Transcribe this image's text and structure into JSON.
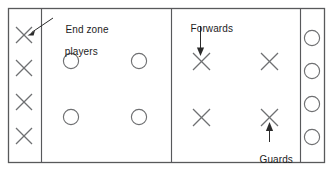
{
  "diagram": {
    "type": "sports-formation",
    "colors": {
      "border": "#58595b",
      "divider": "#58595b",
      "mark": "#6f7072",
      "leader": "#2b2b2b",
      "text": "#1d1d1d",
      "background": "#ffffff"
    },
    "field": {
      "x": 8,
      "y": 8,
      "width": 317,
      "height": 155,
      "dividers_x": [
        41,
        171,
        300
      ]
    },
    "zones": [
      {
        "name": "left-end-zone",
        "symbol": "X",
        "count": 4,
        "positions": [
          {
            "cx": 24,
            "cy": 35
          },
          {
            "cx": 24,
            "cy": 68
          },
          {
            "cx": 24,
            "cy": 102
          },
          {
            "cx": 24,
            "cy": 136
          }
        ]
      },
      {
        "name": "second-zone-circles",
        "symbol": "O",
        "count": 4,
        "positions": [
          {
            "cx": 71,
            "cy": 61
          },
          {
            "cx": 139,
            "cy": 61
          },
          {
            "cx": 71,
            "cy": 117
          },
          {
            "cx": 139,
            "cy": 117
          }
        ]
      },
      {
        "name": "third-zone-crosses",
        "symbol": "X",
        "count": 4,
        "positions": [
          {
            "cx": 202,
            "cy": 61
          },
          {
            "cx": 270,
            "cy": 61
          },
          {
            "cx": 202,
            "cy": 117
          },
          {
            "cx": 270,
            "cy": 117
          }
        ]
      },
      {
        "name": "right-end-zone",
        "symbol": "O",
        "count": 4,
        "positions": [
          {
            "cx": 312,
            "cy": 38
          },
          {
            "cx": 312,
            "cy": 71
          },
          {
            "cx": 312,
            "cy": 104
          },
          {
            "cx": 312,
            "cy": 137
          }
        ]
      }
    ],
    "annotations": [
      {
        "id": "end-zone-players",
        "line1": "End zone",
        "line2": "players",
        "target": "left-end-zone top X",
        "arrow": {
          "from_x": 52,
          "from_y": 19,
          "to_x": 29,
          "to_y": 33,
          "direction": "down-left"
        }
      },
      {
        "id": "forwards",
        "text": "Forwards",
        "target": "third-zone top-left X",
        "arrow": {
          "from_x": 200,
          "from_y": 26,
          "to_x": 200,
          "to_y": 54,
          "direction": "down"
        }
      },
      {
        "id": "guards",
        "text": "Guards",
        "target": "third-zone bottom-right X",
        "arrow": {
          "from_x": 269,
          "from_y": 141,
          "to_x": 269,
          "to_y": 124,
          "direction": "up"
        }
      }
    ]
  },
  "labels": {
    "end_zone_line1": "End zone",
    "end_zone_line2": "players",
    "forwards": "Forwards",
    "guards": "Guards"
  }
}
